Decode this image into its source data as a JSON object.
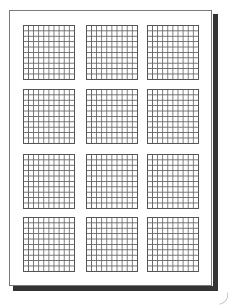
{
  "document": {
    "type": "graph-paper-page",
    "layout": {
      "rows": 4,
      "columns": 3,
      "cells_per_grid": {
        "columns": 10,
        "rows": 10
      }
    },
    "colors": {
      "background": "#ffffff",
      "page_border": "#7a7a7a",
      "grid_line": "#555555",
      "shadow": "#333333"
    },
    "grids": [
      {
        "id": "r1c1",
        "row": 1,
        "col": 1,
        "left": 23,
        "top": 25
      },
      {
        "id": "r1c2",
        "row": 1,
        "col": 2,
        "left": 86,
        "top": 25
      },
      {
        "id": "r1c3",
        "row": 1,
        "col": 3,
        "left": 147,
        "top": 25
      },
      {
        "id": "r2c1",
        "row": 2,
        "col": 1,
        "left": 23,
        "top": 89
      },
      {
        "id": "r2c2",
        "row": 2,
        "col": 2,
        "left": 86,
        "top": 89
      },
      {
        "id": "r2c3",
        "row": 2,
        "col": 3,
        "left": 147,
        "top": 89
      },
      {
        "id": "r3c1",
        "row": 3,
        "col": 1,
        "left": 23,
        "top": 154
      },
      {
        "id": "r3c2",
        "row": 3,
        "col": 2,
        "left": 86,
        "top": 154
      },
      {
        "id": "r3c3",
        "row": 3,
        "col": 3,
        "left": 147,
        "top": 154
      },
      {
        "id": "r4c1",
        "row": 4,
        "col": 1,
        "left": 23,
        "top": 217
      },
      {
        "id": "r4c2",
        "row": 4,
        "col": 2,
        "left": 86,
        "top": 217
      },
      {
        "id": "r4c3",
        "row": 4,
        "col": 3,
        "left": 147,
        "top": 217
      }
    ]
  }
}
